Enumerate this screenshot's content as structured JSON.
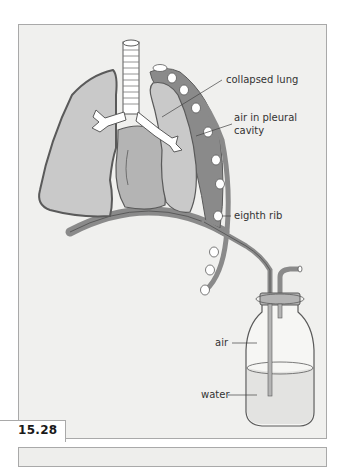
{
  "figure": {
    "number": "15.28",
    "labels": {
      "collapsed_lung": "collapsed lung",
      "air_pleural_1": "air in pleural",
      "air_pleural_2": "cavity",
      "eighth_rib": "eighth rib",
      "air": "air",
      "water": "water"
    },
    "colors": {
      "panel_bg": "#f0f0ee",
      "lung_fill": "#c9c9c9",
      "outline": "#5a5a5a",
      "pleural_dark": "#8a8a8a",
      "heart_fill": "#b4b4b4"
    }
  }
}
